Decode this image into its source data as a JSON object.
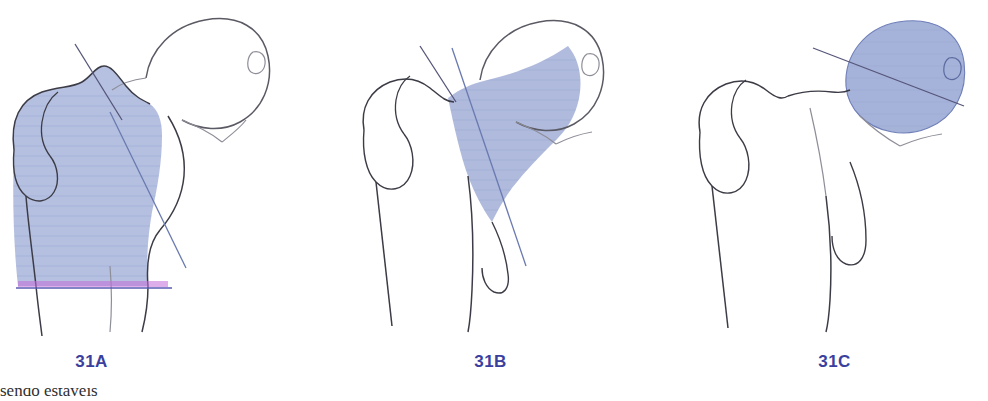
{
  "document": {
    "title": "AO/OTA classification of proximal femur fractures",
    "background_color": "#ffffff",
    "width": 988,
    "height": 401
  },
  "style": {
    "shade_fill": "#9aa8d4",
    "shade_fill_light": "#a9b4d9",
    "outline_color": "#3c3c46",
    "outline_color_light": "#8e8e99",
    "reference_line_color": "#4a4a6a",
    "magenta_line_color": "#b83fd0",
    "caption_color": "#3b3f9e"
  },
  "figures": [
    {
      "id": "31A",
      "caption": "31A",
      "region_name": "trochanteric-region",
      "description": "Trochanteric area fracture zone shaded",
      "shaded_part": "greater and lesser trochanter / trochanteric region",
      "has_magenta_reference_line": true,
      "reference_line_count": 2
    },
    {
      "id": "31B",
      "caption": "31B",
      "region_name": "femoral-neck",
      "description": "Femoral neck fracture zone shaded",
      "shaded_part": "femoral neck",
      "has_magenta_reference_line": false,
      "reference_line_count": 2
    },
    {
      "id": "31C",
      "caption": "31C",
      "region_name": "femoral-head",
      "description": "Femoral head fracture zone shaded",
      "shaded_part": "femoral head",
      "has_magenta_reference_line": false,
      "reference_line_count": 1
    }
  ],
  "footer": {
    "clipped_text": "sendo estáveis"
  }
}
